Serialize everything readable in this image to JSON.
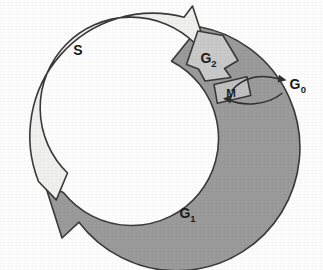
{
  "diagram": {
    "background_color": "#fdfdfd",
    "outline_color": "#3a3a3a",
    "center": {
      "x": 141,
      "y": 135
    },
    "radii": {
      "inner": 87,
      "outer": 123
    },
    "phases": [
      {
        "id": "s-phase",
        "label": "S",
        "subscript": "",
        "fill_color": "#f0f0ee",
        "shape": "curved-block-arrow",
        "arrow_direction": "clockwise",
        "label_position": {
          "x": 78,
          "y": 55
        }
      },
      {
        "id": "g2-phase",
        "label": "G",
        "subscript": "2",
        "fill_color": "#c9c9c9",
        "shape": "block-arrow-pentagon",
        "arrow_direction": "clockwise",
        "label_position": {
          "x": 206,
          "y": 63
        }
      },
      {
        "id": "m-phase",
        "label": "M",
        "subscript": "",
        "fill_color": "#c0c0c0",
        "shape": "rotated-rectangle",
        "arrow_direction": "clockwise",
        "label_position": {
          "x": 231,
          "y": 97
        }
      },
      {
        "id": "g1-phase",
        "label": "G",
        "subscript": "1",
        "fill_color": "#9b9b9b",
        "shape": "curved-block-arrow",
        "arrow_direction": "clockwise",
        "label_position": {
          "x": 185,
          "y": 218
        }
      }
    ],
    "exit_state": {
      "id": "g0-state",
      "label": "G",
      "subscript": "0",
      "label_position": {
        "x": 295,
        "y": 89
      },
      "arrows": [
        {
          "id": "exit-arrow",
          "from": "m-phase",
          "to": "g0-state",
          "direction": "out"
        },
        {
          "id": "reentry-arrow",
          "from": "g0-state",
          "to": "cycle",
          "direction": "in"
        }
      ]
    },
    "legend": {
      "cycle_order": [
        "G1",
        "S",
        "G2",
        "M"
      ],
      "quiescent_state": "G0"
    }
  }
}
